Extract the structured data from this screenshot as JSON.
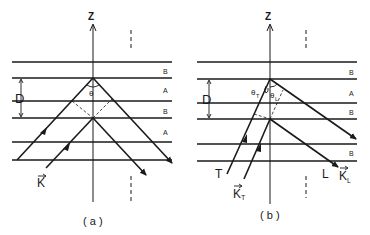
{
  "panels": [
    {
      "id": "a",
      "caption": "( a )",
      "axis_label": "Z",
      "layers": [
        "B",
        "A",
        "B",
        "A"
      ],
      "spacing_label": "D",
      "angle_label": "θ",
      "wavevector_label": "K"
    },
    {
      "id": "b",
      "caption": "( b )",
      "axis_label": "Z",
      "layers": [
        "B",
        "A",
        "B",
        "B"
      ],
      "spacing_label": "D",
      "angle_labels": {
        "transverse": "θ",
        "transverse_sub": "T",
        "longitudinal": "θ",
        "longitudinal_sub": "L"
      },
      "mode_labels": {
        "transverse": "T",
        "longitudinal": "L"
      },
      "wavevector_labels": {
        "transverse": "K",
        "transverse_sub": "T",
        "longitudinal": "K",
        "longitudinal_sub": "L"
      }
    }
  ],
  "colors": {
    "line": "#1a1a1a",
    "background": "#ffffff"
  }
}
